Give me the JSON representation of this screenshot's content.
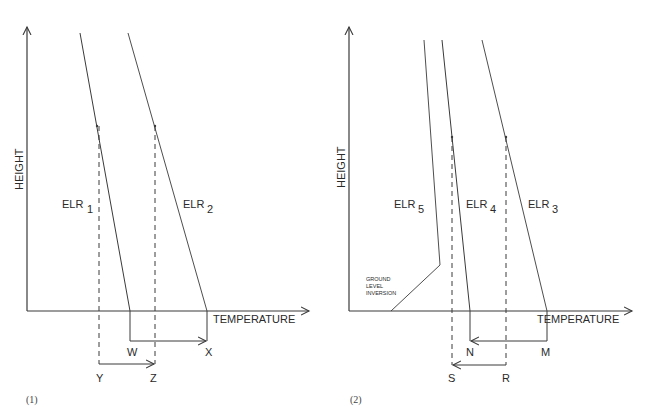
{
  "panels": [
    {
      "caption": "(1)",
      "y_axis_label": "HEIGHT",
      "x_axis_label": "TEMPERATURE",
      "curves": [
        {
          "name": "ELR",
          "sub": "1"
        },
        {
          "name": "ELR",
          "sub": "2"
        }
      ],
      "points": {
        "w": "W",
        "x": "X",
        "y": "Y",
        "z": "Z"
      }
    },
    {
      "caption": "(2)",
      "y_axis_label": "HEIGHT",
      "x_axis_label": "TEMPERATURE",
      "curves": [
        {
          "name": "ELR",
          "sub": "5"
        },
        {
          "name": "ELR",
          "sub": "4"
        },
        {
          "name": "ELR",
          "sub": "3"
        }
      ],
      "annotation": [
        "GROUND",
        "LEVEL",
        "INVERSION"
      ],
      "points": {
        "n": "N",
        "m": "M",
        "s": "S",
        "r": "R"
      }
    }
  ],
  "colors": {
    "line": "#3a3a3a",
    "text": "#2a2a2a"
  }
}
